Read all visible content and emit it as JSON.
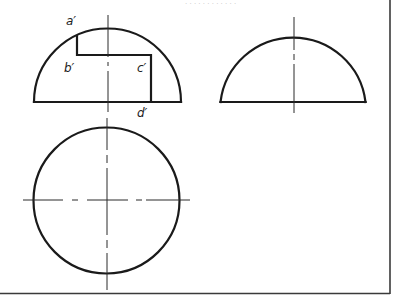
{
  "header_fragment": "· · · · ·  · · · · · · ·",
  "views": {
    "front": {
      "name": "Front view (notched hemisphere)",
      "labels": {
        "a": "a′",
        "b": "b′",
        "c": "c′",
        "d": "d′"
      }
    },
    "side": {
      "name": "Side view (hemisphere)"
    },
    "top": {
      "name": "Top view (circle)"
    }
  },
  "colors": {
    "line": "#1a1a1a",
    "centerline": "#2a2a2a",
    "border": "#3a3a3a",
    "background": "#ffffff"
  }
}
